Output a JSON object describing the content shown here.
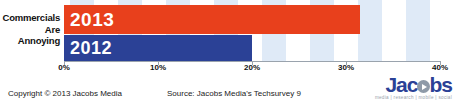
{
  "chart_data": {
    "type": "bar",
    "orientation": "horizontal",
    "title": "",
    "xlabel": "",
    "ylabel": "",
    "categories": [
      "Commercials Are Annoying"
    ],
    "category_label_lines": [
      "Commercials",
      "Are",
      "Annoying"
    ],
    "series": [
      {
        "name": "2013",
        "values": [
          31.5
        ],
        "color": "#e8401c"
      },
      {
        "name": "2012",
        "values": [
          20.0
        ],
        "color": "#2b4196"
      }
    ],
    "xlim": [
      0,
      40
    ],
    "xticks": [
      0,
      10,
      20,
      30,
      40
    ],
    "xtick_labels": [
      "0%",
      "10%",
      "20%",
      "30%",
      "40%"
    ],
    "grid": false,
    "alternating_bands": true,
    "band_color": "#dfeaf7",
    "legend": "none",
    "data_labels_inside_bars": [
      "2013",
      "2012"
    ]
  },
  "bars": [
    {
      "label": "2013",
      "value_pct": 31.5
    },
    {
      "label": "2012",
      "value_pct": 20.0
    }
  ],
  "footer": {
    "copyright": "Copyright © 2013 Jacobs Media",
    "source": "Source: Jacobs Media's Techsurvey 9"
  },
  "logo": {
    "word_start": "Jac",
    "word_end": "bs",
    "tagline": "media | research | mobile | social",
    "color": "#2b4196"
  }
}
